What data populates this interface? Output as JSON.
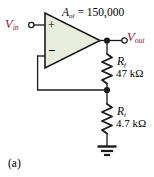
{
  "figure": {
    "caption": "(a)",
    "background_color": "#ffffff",
    "line_color": "#1a1a1a",
    "label_color": "#000000",
    "terminal_label_color": "#8a1538",
    "opamp_fill_color": "#e8ecdc"
  },
  "circuit": {
    "type": "non-inverting-operational-amplifier",
    "opamp": {
      "name": "op-amp",
      "gain_label_prefix": "A",
      "gain_label_subscript": "ol",
      "gain_label_equals": " = 150,000",
      "gain_value": "150,000",
      "gain_full_text": "A_ol = 150,000",
      "noninverting_input_symbol": "+",
      "inverting_input_symbol": "−"
    },
    "terminals": [
      {
        "name": "input-terminal",
        "label_prefix": "V",
        "label_subscript": "in",
        "full_text": "V_in",
        "style": "open-circle"
      },
      {
        "name": "output-terminal",
        "label_prefix": "V",
        "label_subscript": "out",
        "full_text": "V_out",
        "style": "open-circle"
      }
    ],
    "components": [
      {
        "name": "feedback-resistor",
        "designator_prefix": "R",
        "designator_subscript": "f",
        "value": "47 kΩ",
        "resistance_ohms": 47000
      },
      {
        "name": "input-resistor",
        "designator_prefix": "R",
        "designator_subscript": "i",
        "value": "4.7 kΩ",
        "resistance_ohms": 4700
      }
    ],
    "ground": {
      "name": "ground-symbol",
      "style": "three-bar-earth"
    },
    "nodes": [
      {
        "name": "output-node",
        "style": "filled-dot"
      },
      {
        "name": "feedback-junction-node",
        "style": "filled-dot"
      }
    ]
  }
}
